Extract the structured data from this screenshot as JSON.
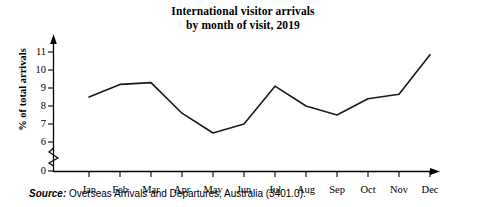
{
  "title": {
    "line1": "International visitor arrivals",
    "line2": "by month of visit, 2019"
  },
  "source": {
    "lead": "Source:",
    "text": " Overseas Arrivals and Departures, Australia (3401.0)."
  },
  "chart_data": {
    "type": "line",
    "title": "International visitor arrivals by month of visit, 2019",
    "xlabel": "",
    "ylabel": "% of total arrivals",
    "categories": [
      "Jan",
      "Feb",
      "Mar",
      "Apr",
      "May",
      "Jun",
      "Jul",
      "Aug",
      "Sep",
      "Oct",
      "Nov",
      "Dec"
    ],
    "values": [
      8.5,
      9.2,
      9.3,
      7.6,
      6.5,
      7.0,
      9.1,
      8.0,
      7.5,
      8.4,
      8.65,
      10.85
    ],
    "ytick_labels": [
      "0",
      "6",
      "7",
      "8",
      "9",
      "10",
      "11"
    ],
    "ylim": [
      0,
      11.6
    ],
    "axis_break": true,
    "axis_break_between": [
      0,
      6
    ],
    "grid": false,
    "legend": false,
    "line_color": "#1a1a1a",
    "axis_color": "#000000"
  }
}
